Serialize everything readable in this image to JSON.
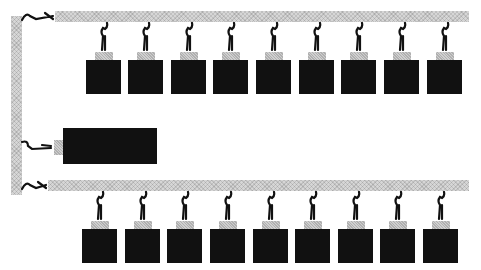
{
  "diagram": {
    "colors": {
      "bus": "#d6d6d6",
      "module": "#111111",
      "connector": "#cfcfcf",
      "cable": "#111111",
      "background": "#ffffff"
    },
    "trunk": {
      "x": 11,
      "y": 16,
      "w": 11,
      "h": 179
    },
    "buses": [
      {
        "id": "top-bus",
        "bar": {
          "x": 55,
          "y": 11,
          "w": 414,
          "h": 11
        },
        "trunk_cable_y": 16,
        "module_y": 60,
        "module_size": 35,
        "module_x": [
          86,
          128,
          171,
          213,
          256,
          299,
          341,
          384,
          427
        ]
      },
      {
        "id": "bottom-bus",
        "bar": {
          "x": 48,
          "y": 180,
          "w": 421,
          "h": 11
        },
        "trunk_cable_y": 185,
        "module_y": 229,
        "module_size": 35,
        "module_x": [
          82,
          125,
          167,
          210,
          253,
          295,
          338,
          380,
          423
        ]
      }
    ],
    "large_module": {
      "x": 63,
      "y": 128,
      "w": 94,
      "h": 36,
      "trunk_cable_y": 146
    }
  }
}
